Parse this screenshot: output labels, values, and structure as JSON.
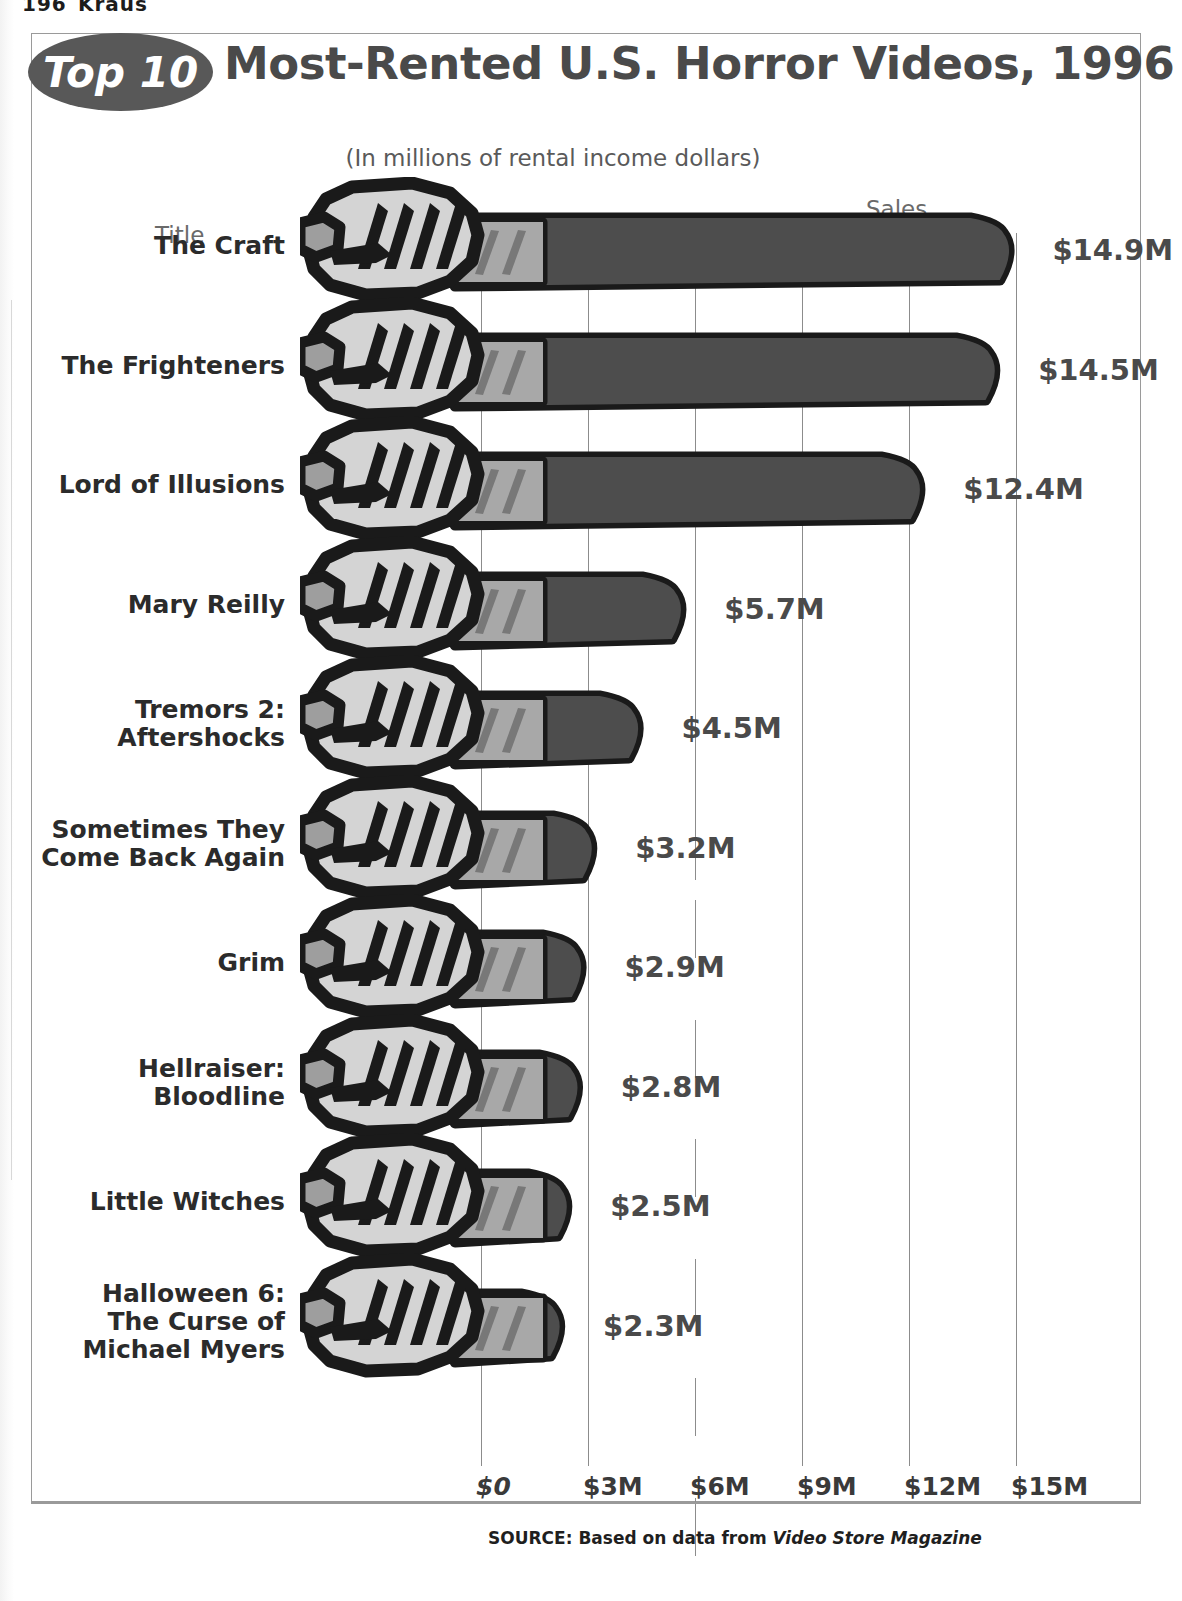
{
  "page": {
    "header_number": "196",
    "header_word": "Kraus"
  },
  "chart": {
    "badge": "Top 10",
    "title": "Most-Rented U.S. Horror Videos, 1996",
    "subtitle": "(In millions of rental income dollars)",
    "axis_title_left": "Title",
    "axis_title_right": "Sales",
    "source_prefix": "SOURCE: Based on data from ",
    "source_magazine": "Video Store Magazine",
    "colors": {
      "badge_fill": "#585858",
      "badge_text": "#ffffff",
      "title_text": "#4a4a4a",
      "blade_dark": "#4d4d4d",
      "blade_outline": "#1a1a1a",
      "hilt_light": "#a8a8a8",
      "hand_light": "#d4d4d4",
      "gridline": "#8c8c8c",
      "frame_border": "#9a9a9a"
    }
  },
  "chart_data": {
    "type": "bar",
    "orientation": "horizontal",
    "title": "Top 10 Most-Rented U.S. Horror Videos, 1996",
    "subtitle": "(In millions of rental income dollars)",
    "xlabel": "Sales",
    "ylabel": "Title",
    "unit": "millions of USD",
    "xlim": [
      0,
      15
    ],
    "xticks": [
      0,
      3,
      6,
      9,
      12,
      15
    ],
    "xticklabels": [
      "$0",
      "$3M",
      "$6M",
      "$9M",
      "$12M",
      "$15M"
    ],
    "grid": true,
    "legend": false,
    "categories": [
      "The Craft",
      "The Frighteners",
      "Lord of Illusions",
      "Mary Reilly",
      "Tremors 2: Aftershocks",
      "Sometimes They Come Back Again",
      "Grim",
      "Hellraiser: Bloodline",
      "Little Witches",
      "Halloween 6: The Curse of Michael Myers"
    ],
    "values": [
      14.9,
      14.5,
      12.4,
      5.7,
      4.5,
      3.2,
      2.9,
      2.8,
      2.5,
      2.3
    ],
    "data_labels": [
      "$14.9M",
      "$14.5M",
      "$12.4M",
      "$5.7M",
      "$4.5M",
      "$3.2M",
      "$2.9M",
      "$2.8M",
      "$2.5M",
      "$2.3M"
    ],
    "source": "SOURCE: Based on data from Video Store Magazine"
  },
  "rows": [
    {
      "label": "The Craft",
      "label_lines": [
        "The Craft"
      ],
      "value": 14.9,
      "data_label": "$14.9M"
    },
    {
      "label": "The Frighteners",
      "label_lines": [
        "The Frighteners"
      ],
      "value": 14.5,
      "data_label": "$14.5M"
    },
    {
      "label": "Lord of Illusions",
      "label_lines": [
        "Lord of Illusions"
      ],
      "value": 12.4,
      "data_label": "$12.4M"
    },
    {
      "label": "Mary Reilly",
      "label_lines": [
        "Mary Reilly"
      ],
      "value": 5.7,
      "data_label": "$5.7M"
    },
    {
      "label": "Tremors 2: Aftershocks",
      "label_lines": [
        "Tremors 2:",
        "Aftershocks"
      ],
      "value": 4.5,
      "data_label": "$4.5M"
    },
    {
      "label": "Sometimes They Come Back Again",
      "label_lines": [
        "Sometimes They",
        "Come Back Again"
      ],
      "value": 3.2,
      "data_label": "$3.2M"
    },
    {
      "label": "Grim",
      "label_lines": [
        "Grim"
      ],
      "value": 2.9,
      "data_label": "$2.9M"
    },
    {
      "label": "Hellraiser: Bloodline",
      "label_lines": [
        "Hellraiser:",
        "Bloodline"
      ],
      "value": 2.8,
      "data_label": "$2.8M"
    },
    {
      "label": "Little Witches",
      "label_lines": [
        "Little Witches"
      ],
      "value": 2.5,
      "data_label": "$2.5M"
    },
    {
      "label": "Halloween 6: The Curse of Michael Myers",
      "label_lines": [
        "Halloween 6:",
        "The Curse of",
        "Michael Myers"
      ],
      "value": 2.3,
      "data_label": "$2.3M"
    }
  ]
}
